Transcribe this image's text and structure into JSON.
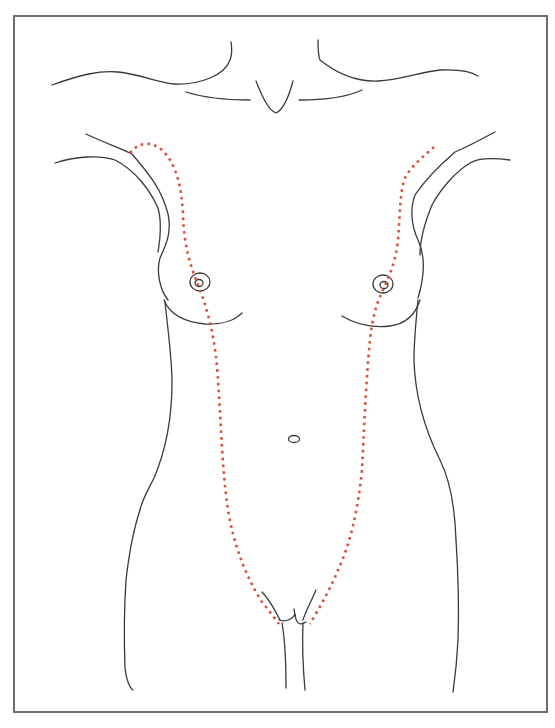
{
  "figure": {
    "type": "anatomical-line-drawing",
    "colors": {
      "outline": "#3a3a3a",
      "milk_line": "#d9503f",
      "frame_border": "#6e6e6e",
      "background": "#ffffff"
    },
    "elements": [
      {
        "name": "neck-and-clavicles",
        "style": "solid outline"
      },
      {
        "name": "shoulders-and-axillae",
        "style": "solid outline"
      },
      {
        "name": "breasts-with-areolae",
        "style": "solid outline"
      },
      {
        "name": "navel",
        "style": "solid outline"
      },
      {
        "name": "waist-hips-and-thighs",
        "style": "solid outline"
      },
      {
        "name": "left-milk-line",
        "style": "red dotted",
        "from": "left axilla",
        "to": "left groin"
      },
      {
        "name": "right-milk-line",
        "style": "red dotted",
        "from": "right axilla",
        "to": "right groin"
      }
    ]
  },
  "caption": "Milk lines (mammary ridges) from axilla to groin"
}
